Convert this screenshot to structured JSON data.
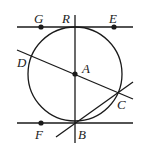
{
  "diagram": {
    "type": "geometry",
    "circle": {
      "center": "A",
      "cx": 75,
      "cy": 74,
      "r": 47
    },
    "points": [
      {
        "id": "G",
        "label": "G",
        "x": 41,
        "y": 27,
        "dot": true,
        "lx": 34,
        "ly": 12
      },
      {
        "id": "R",
        "label": "R",
        "x": 75,
        "y": 27,
        "dot": false,
        "lx": 62,
        "ly": 12
      },
      {
        "id": "E",
        "label": "E",
        "x": 114,
        "y": 27,
        "dot": true,
        "lx": 109,
        "ly": 12
      },
      {
        "id": "D",
        "label": "D",
        "x": 31,
        "y": 61,
        "dot": false,
        "lx": 17,
        "ly": 56
      },
      {
        "id": "A",
        "label": "A",
        "x": 75,
        "y": 74,
        "dot": true,
        "lx": 82,
        "ly": 62
      },
      {
        "id": "C",
        "label": "C",
        "x": 118,
        "y": 92,
        "dot": false,
        "lx": 117,
        "ly": 98
      },
      {
        "id": "F",
        "label": "F",
        "x": 41,
        "y": 123,
        "dot": true,
        "lx": 35,
        "ly": 128
      },
      {
        "id": "B",
        "label": "B",
        "x": 75,
        "y": 123,
        "dot": false,
        "lx": 78,
        "ly": 128
      }
    ],
    "lines": [
      {
        "name": "tangent-top-GE",
        "x1": 17,
        "y1": 27,
        "x2": 133,
        "y2": 27
      },
      {
        "name": "tangent-bottom-FB",
        "x1": 17,
        "y1": 123,
        "x2": 133,
        "y2": 123
      },
      {
        "name": "diameter-RB",
        "x1": 75,
        "y1": 15,
        "x2": 75,
        "y2": 143
      },
      {
        "name": "secant-DAC",
        "x1": 17,
        "y1": 50,
        "x2": 133,
        "y2": 99
      },
      {
        "name": "line-BC",
        "x1": 56,
        "y1": 137,
        "x2": 133,
        "y2": 82
      }
    ],
    "colors": {
      "stroke": "#1a1a1a",
      "background": "#ffffff"
    }
  }
}
